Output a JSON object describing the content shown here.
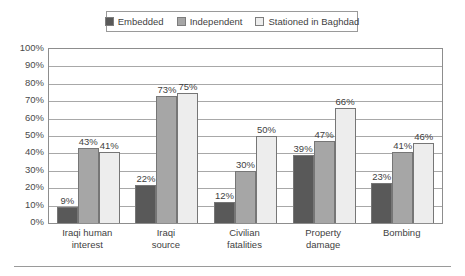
{
  "chart_data": {
    "type": "bar",
    "title": "",
    "subtitle": "",
    "xlabel": "",
    "ylabel": "",
    "ylim": [
      0,
      100
    ],
    "ytick_step": 10,
    "grid": true,
    "legend_position": "top",
    "value_labels": true,
    "value_suffix": "%",
    "categories": [
      "Iraqi human interest",
      "Iraqi source",
      "Civilian fatalities",
      "Property damage",
      "Bombing"
    ],
    "category_lines": [
      [
        "Iraqi human",
        "interest"
      ],
      [
        "Iraqi",
        "source"
      ],
      [
        "Civilian",
        "fatalities"
      ],
      [
        "Property",
        "damage"
      ],
      [
        "Bombing"
      ]
    ],
    "series": [
      {
        "name": "Embedded",
        "color": "#595959",
        "values": [
          9,
          22,
          12,
          39,
          23
        ],
        "labels": [
          "9%",
          "22%",
          "12%",
          "39%",
          "23%"
        ]
      },
      {
        "name": "Independent",
        "color": "#a6a6a6",
        "values": [
          43,
          73,
          30,
          47,
          41
        ],
        "labels": [
          "43%",
          "73%",
          "30%",
          "47%",
          "41%"
        ]
      },
      {
        "name": "Stationed in Baghdad",
        "color": "#ededed",
        "values": [
          41,
          75,
          50,
          66,
          46
        ],
        "labels": [
          "41%",
          "75%",
          "50%",
          "66%",
          "46%"
        ]
      }
    ],
    "ytick_labels": [
      "100%",
      "90%",
      "80%",
      "70%",
      "60%",
      "50%",
      "40%",
      "30%",
      "20%",
      "10%",
      "0%"
    ],
    "ytick_values": [
      100,
      90,
      80,
      70,
      60,
      50,
      40,
      30,
      20,
      10,
      0
    ]
  },
  "legend": {
    "entries": [
      {
        "label": "Embedded",
        "color": "#595959"
      },
      {
        "label": "Independent",
        "color": "#a6a6a6"
      },
      {
        "label": "Stationed in Baghdad",
        "color": "#ededed"
      }
    ]
  }
}
